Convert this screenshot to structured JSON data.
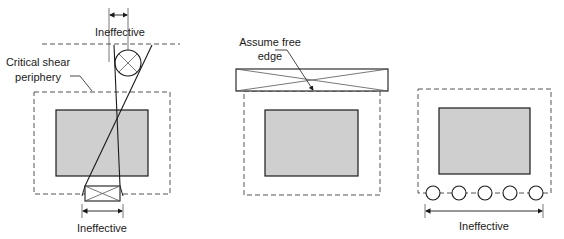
{
  "figure": {
    "colors": {
      "column_fill": "#cfcfcf",
      "line": "#1a1a1a",
      "dashed": "#555555"
    },
    "panel_left": {
      "dimension_top_label": "Ineffective",
      "periphery_label_line1": "Critical shear",
      "periphery_label_line2": "periphery",
      "dimension_bottom_label": "Ineffective"
    },
    "panel_middle": {
      "free_edge_label_line1": "Assume free",
      "free_edge_label_line2": "edge"
    },
    "panel_right": {
      "dimension_label": "Ineffective",
      "opening_count": 5
    }
  }
}
